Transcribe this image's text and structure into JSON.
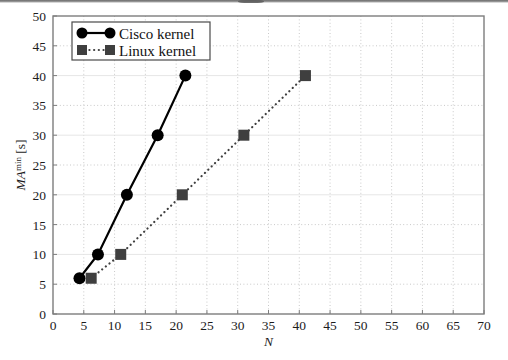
{
  "chart_data": {
    "type": "line",
    "title": "",
    "subtitle": "",
    "xlabel": "N",
    "ylabel": "MA",
    "ylabel_sup": "min",
    "ylabel_unit": "[s]",
    "ylabel_full": "MA^min [s]",
    "xlim": [
      0,
      70
    ],
    "ylim": [
      0,
      50
    ],
    "xticks": [
      0,
      5,
      10,
      15,
      20,
      25,
      30,
      35,
      40,
      45,
      50,
      55,
      60,
      65,
      70
    ],
    "yticks": [
      0,
      5,
      10,
      15,
      20,
      25,
      30,
      35,
      40,
      45,
      50
    ],
    "xtick_labels": [
      "0",
      "5",
      "10",
      "15",
      "20",
      "25",
      "30",
      "35",
      "40",
      "45",
      "50",
      "55",
      "60",
      "65",
      "70"
    ],
    "ytick_labels": [
      "0",
      "5",
      "10",
      "15",
      "20",
      "25",
      "30",
      "35",
      "40",
      "45",
      "50"
    ],
    "grid": true,
    "grid_style": "dotted vertical at every 5; horizontal dotted at 5,15,25,35,45 and solid light at 10,20,30,40",
    "legend_position": "top-left inside plot",
    "series": [
      {
        "name": "Cisco kernel",
        "marker": "circle",
        "line_style": "solid",
        "color": "#000000",
        "points": [
          {
            "x": 4.3,
            "y": 6
          },
          {
            "x": 7.3,
            "y": 10
          },
          {
            "x": 12.0,
            "y": 20
          },
          {
            "x": 17.0,
            "y": 30
          },
          {
            "x": 21.5,
            "y": 40
          }
        ]
      },
      {
        "name": "Linux kernel",
        "marker": "square",
        "line_style": "dotted",
        "color": "#3f3f3f",
        "points": [
          {
            "x": 6.2,
            "y": 6
          },
          {
            "x": 11.0,
            "y": 10
          },
          {
            "x": 21.0,
            "y": 20
          },
          {
            "x": 31.0,
            "y": 30
          },
          {
            "x": 41.0,
            "y": 40
          }
        ]
      }
    ],
    "legend": [
      {
        "label": "Cisco kernel",
        "marker": "circle",
        "line_style": "solid",
        "color": "#000000"
      },
      {
        "label": "Linux kernel",
        "marker": "square",
        "line_style": "dotted",
        "color": "#3f3f3f"
      }
    ]
  },
  "colors": {
    "background": "#ffffff",
    "frame": "#7d7d7d",
    "grid_dotted": "#c9c9c9",
    "grid_solid": "#e6e6e6",
    "series_cisco": "#000000",
    "series_linux": "#3f3f3f",
    "text": "#1c1c1c"
  }
}
